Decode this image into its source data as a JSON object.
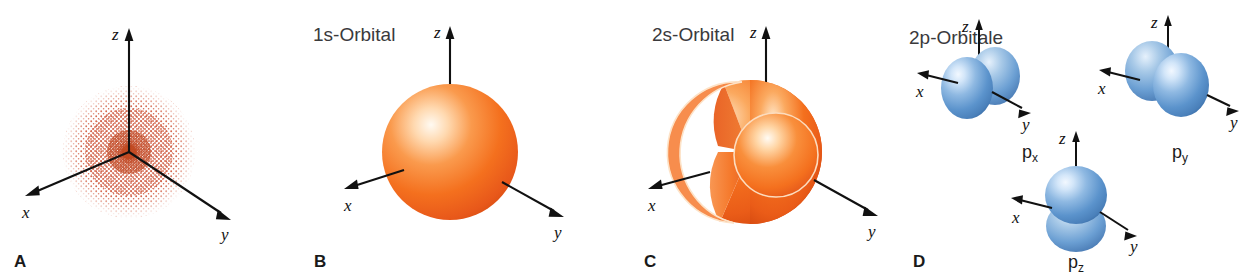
{
  "figure": {
    "background_color": "#ffffff",
    "orange_color": "#f4701e",
    "orange_highlight": "#fff2e4",
    "orange_dark": "#d94e12",
    "blue_color": "#5b93cc",
    "blue_highlight": "#e2eefb",
    "blue_dark": "#3b6ea8",
    "dot_color": "#d4654a",
    "axis_color": "#111111"
  },
  "panels": [
    {
      "letter": "A",
      "title": "",
      "caption_note": "electron density dot cloud",
      "axes": {
        "x": "x",
        "y": "y",
        "z": "z"
      },
      "color": "#d4654a"
    },
    {
      "letter": "B",
      "title": "1s-Orbital",
      "axes": {
        "x": "x",
        "y": "y",
        "z": "z"
      },
      "color": "#f4701e"
    },
    {
      "letter": "C",
      "title": "2s-Orbital",
      "axes": {
        "x": "x",
        "y": "y",
        "z": "z"
      },
      "color": "#f4701e"
    },
    {
      "letter": "D",
      "title": "2p-Orbitale",
      "axes": {
        "x": "x",
        "y": "y",
        "z": "z"
      },
      "color": "#5b93cc",
      "orbitals": [
        {
          "base": "p",
          "sub": "x"
        },
        {
          "base": "p",
          "sub": "y"
        },
        {
          "base": "p",
          "sub": "z"
        }
      ]
    }
  ],
  "axis_labels": {
    "x": "x",
    "y": "y",
    "z": "z"
  }
}
